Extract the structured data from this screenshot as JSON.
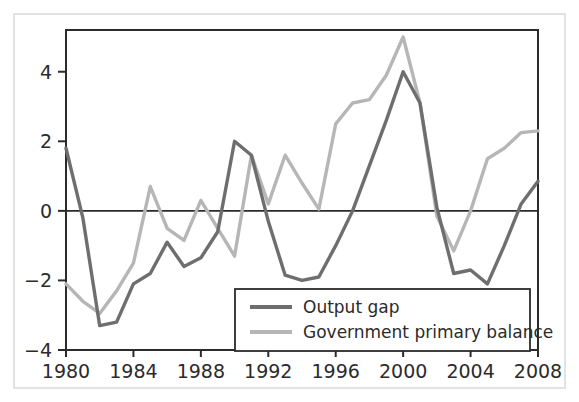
{
  "chart_data": {
    "type": "line",
    "title": "",
    "subtitle": "",
    "xlabel": "",
    "ylabel": "",
    "xlim": [
      1980,
      2008
    ],
    "ylim": [
      -4,
      5.2
    ],
    "yticks": [
      -4,
      -2,
      0,
      2,
      4
    ],
    "ytick_labels": [
      "−4",
      "−2",
      "0",
      "2",
      "4"
    ],
    "xticks": [
      1980,
      1984,
      1988,
      1992,
      1996,
      2000,
      2004,
      2008
    ],
    "xtick_labels": [
      "1980",
      "1984",
      "1988",
      "1992",
      "1996",
      "2000",
      "2004",
      "2008"
    ],
    "grid": false,
    "zero_line": true,
    "legend_position": "bottom-right",
    "x": [
      1980,
      1981,
      1982,
      1983,
      1984,
      1985,
      1986,
      1987,
      1988,
      1989,
      1990,
      1991,
      1992,
      1993,
      1994,
      1995,
      1996,
      1997,
      1998,
      1999,
      2000,
      2001,
      2002,
      2003,
      2004,
      2005,
      2006,
      2007,
      2008
    ],
    "series": [
      {
        "name": "Output gap",
        "color": "#6e6e6e",
        "values": [
          1.8,
          -0.2,
          -3.3,
          -3.2,
          -2.1,
          -1.8,
          -0.9,
          -1.6,
          -1.35,
          -0.6,
          2.0,
          1.6,
          -0.3,
          -1.85,
          -2.0,
          -1.9,
          -1.0,
          0.0,
          1.3,
          2.6,
          4.0,
          3.1,
          0.1,
          -1.8,
          -1.7,
          -2.1,
          -1.0,
          0.2,
          0.85
        ]
      },
      {
        "name": "Government primary balance",
        "color": "#b6b6b6",
        "values": [
          -2.1,
          -2.6,
          -2.95,
          -2.3,
          -1.5,
          0.7,
          -0.5,
          -0.85,
          0.3,
          -0.5,
          -1.3,
          1.6,
          0.2,
          1.6,
          0.8,
          0.05,
          2.5,
          3.1,
          3.2,
          3.9,
          5.0,
          3.1,
          -0.15,
          -1.15,
          0.0,
          1.5,
          1.8,
          2.25,
          2.3
        ]
      }
    ]
  },
  "legend": {
    "entries": [
      {
        "label": "Output gap",
        "color": "#6e6e6e"
      },
      {
        "label": "Government primary balance",
        "color": "#b6b6b6"
      }
    ]
  },
  "colors": {
    "output_gap": "#6e6e6e",
    "primary_balance": "#b6b6b6",
    "axis": "#2b2b2b",
    "frame": "#e2e2e2",
    "background": "#ffffff"
  }
}
